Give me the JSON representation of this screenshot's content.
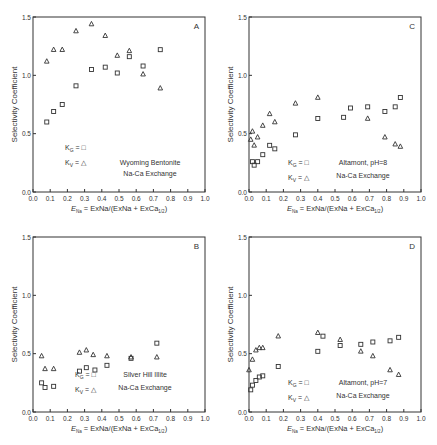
{
  "chart_data": [
    {
      "type": "scatter",
      "panel": "A",
      "title": "",
      "xlabel": "E_Na = ExNa/(ExNa + ExCa1/2)",
      "ylabel": "Selectivity Coefficient",
      "xlim": [
        0.0,
        1.0
      ],
      "ylim": [
        0.0,
        1.5
      ],
      "xticks": [
        "0.0",
        "0.1",
        "0.2",
        "0.3",
        "0.4",
        "0.5",
        "0.6",
        "0.7",
        "0.8",
        "0.9",
        "1.0"
      ],
      "yticks": [
        "0.0",
        "0.5",
        "1.0",
        "1.5"
      ],
      "grid": false,
      "legend": [
        "K_G = □",
        "K_V = △"
      ],
      "annotation": [
        "Wyoming Bentonite",
        "Na-Ca Exchange"
      ],
      "series": [
        {
          "name": "K_G",
          "marker": "square",
          "x": [
            0.08,
            0.12,
            0.17,
            0.25,
            0.34,
            0.42,
            0.49,
            0.56,
            0.64,
            0.74
          ],
          "y": [
            0.6,
            0.69,
            0.75,
            0.91,
            1.05,
            1.07,
            1.02,
            1.16,
            1.08,
            1.22
          ]
        },
        {
          "name": "K_V",
          "marker": "triangle",
          "x": [
            0.08,
            0.12,
            0.17,
            0.25,
            0.34,
            0.42,
            0.49,
            0.56,
            0.64,
            0.74
          ],
          "y": [
            1.12,
            1.22,
            1.22,
            1.38,
            1.44,
            1.34,
            1.17,
            1.21,
            1.01,
            0.89
          ]
        }
      ]
    },
    {
      "type": "scatter",
      "panel": "C",
      "title": "",
      "xlabel": "E_Na = ExNa/(ExNa + ExCa1/2)",
      "ylabel": "Selectivity Coefficient",
      "xlim": [
        0.0,
        1.0
      ],
      "ylim": [
        0.0,
        1.5
      ],
      "xticks": [
        "0.0",
        "0.1",
        "0.2",
        "0.3",
        "0.4",
        "0.5",
        "0.6",
        "0.7",
        "0.8",
        "0.9",
        "1.0"
      ],
      "yticks": [
        "0.0",
        "0.5",
        "1.0",
        "1.5"
      ],
      "grid": false,
      "legend": [
        "K_G = □",
        "K_V = △"
      ],
      "annotation": [
        "Altamont, pH=8",
        "Na-Ca Exchange"
      ],
      "series": [
        {
          "name": "K_G",
          "marker": "square",
          "x": [
            0.02,
            0.03,
            0.05,
            0.08,
            0.12,
            0.15,
            0.27,
            0.4,
            0.55,
            0.59,
            0.69,
            0.79,
            0.85,
            0.88
          ],
          "y": [
            0.26,
            0.23,
            0.26,
            0.32,
            0.4,
            0.37,
            0.49,
            0.63,
            0.64,
            0.72,
            0.73,
            0.69,
            0.73,
            0.81
          ]
        },
        {
          "name": "K_V",
          "marker": "triangle",
          "x": [
            0.01,
            0.02,
            0.03,
            0.05,
            0.08,
            0.12,
            0.15,
            0.27,
            0.4,
            0.69,
            0.79,
            0.85,
            0.88
          ],
          "y": [
            0.45,
            0.52,
            0.4,
            0.47,
            0.57,
            0.67,
            0.6,
            0.76,
            0.81,
            0.63,
            0.47,
            0.41,
            0.39
          ]
        }
      ]
    },
    {
      "type": "scatter",
      "panel": "B",
      "title": "",
      "xlabel": "E_Na = ExNa/(ExNa + ExCa1/2)",
      "ylabel": "Selectivity Coefficient",
      "xlim": [
        0.0,
        1.0
      ],
      "ylim": [
        0.0,
        1.5
      ],
      "xticks": [
        "0.0",
        "0.1",
        "0.2",
        "0.3",
        "0.4",
        "0.5",
        "0.6",
        "0.7",
        "0.8",
        "0.9",
        "1.0"
      ],
      "yticks": [
        "0.0",
        "0.5",
        "1.0",
        "1.5"
      ],
      "grid": false,
      "legend": [
        "K_G = □",
        "K_V = △"
      ],
      "annotation": [
        "Silver Hill Illite",
        "Na-Ca Exchange"
      ],
      "series": [
        {
          "name": "K_G",
          "marker": "square",
          "x": [
            0.05,
            0.07,
            0.12,
            0.27,
            0.31,
            0.36,
            0.43,
            0.57,
            0.72
          ],
          "y": [
            0.25,
            0.21,
            0.22,
            0.35,
            0.38,
            0.36,
            0.4,
            0.46,
            0.59
          ]
        },
        {
          "name": "K_V",
          "marker": "triangle",
          "x": [
            0.05,
            0.07,
            0.12,
            0.27,
            0.31,
            0.35,
            0.43,
            0.57,
            0.72
          ],
          "y": [
            0.48,
            0.37,
            0.37,
            0.51,
            0.53,
            0.49,
            0.48,
            0.47,
            0.47
          ]
        }
      ]
    },
    {
      "type": "scatter",
      "panel": "D",
      "title": "",
      "xlabel": "E_Na = ExNa/(ExNa + ExCa1/2)",
      "ylabel": "Selectivity Coefficient",
      "xlim": [
        0.0,
        1.0
      ],
      "ylim": [
        0.0,
        1.5
      ],
      "xticks": [
        "0.0",
        "0.1",
        "0.2",
        "0.3",
        "0.4",
        "0.5",
        "0.6",
        "0.7",
        "0.8",
        "0.9",
        "1.0"
      ],
      "yticks": [
        "0.0",
        "0.5",
        "1.0",
        "1.5"
      ],
      "grid": false,
      "legend": [
        "K_G = □",
        "K_V = △"
      ],
      "annotation": [
        "Altamont, pH=7",
        "Na-Ca Exchange"
      ],
      "series": [
        {
          "name": "K_G",
          "marker": "square",
          "x": [
            0.01,
            0.02,
            0.04,
            0.06,
            0.08,
            0.17,
            0.4,
            0.43,
            0.53,
            0.65,
            0.72,
            0.82,
            0.87
          ],
          "y": [
            0.19,
            0.23,
            0.27,
            0.3,
            0.31,
            0.39,
            0.52,
            0.65,
            0.57,
            0.58,
            0.6,
            0.61,
            0.64
          ]
        },
        {
          "name": "K_V",
          "marker": "triangle",
          "x": [
            0.0,
            0.02,
            0.04,
            0.06,
            0.08,
            0.17,
            0.4,
            0.53,
            0.65,
            0.72,
            0.82,
            0.87
          ],
          "y": [
            0.36,
            0.45,
            0.53,
            0.55,
            0.55,
            0.65,
            0.68,
            0.62,
            0.52,
            0.48,
            0.36,
            0.32
          ]
        }
      ]
    }
  ],
  "panels": {
    "A": {
      "letter": "A",
      "ylabel": "Selectivity Coefficient",
      "xlabel_main": "E",
      "xlabel_sub": "Na",
      "xlabel_rest": " = ExNa/(ExNa + ExCa",
      "xlabel_sub2": "1/2",
      "xlabel_end": ")",
      "legend_kg": "K",
      "legend_kg_sub": "G",
      "legend_kg_eq": " = □",
      "legend_kv": "K",
      "legend_kv_sub": "V",
      "legend_kv_eq": " = △",
      "note1": "Wyoming Bentonite",
      "note2": "Na-Ca Exchange"
    },
    "C": {
      "letter": "C",
      "ylabel": "Selectivity Coefficient",
      "xlabel_main": "E",
      "xlabel_sub": "Na",
      "xlabel_rest": " = ExNa/(ExNa + ExCa",
      "xlabel_sub2": "1/2",
      "xlabel_end": ")",
      "legend_kg": "K",
      "legend_kg_sub": "G",
      "legend_kg_eq": " = □",
      "legend_kv": "K",
      "legend_kv_sub": "V",
      "legend_kv_eq": " = △",
      "note1": "Altamont, pH=8",
      "note2": "Na-Ca Exchange"
    },
    "B": {
      "letter": "B",
      "ylabel": "Selectivity Coefficient",
      "xlabel_main": "E",
      "xlabel_sub": "Na",
      "xlabel_rest": " = ExNa/(ExNa + ExCa",
      "xlabel_sub2": "1/2",
      "xlabel_end": ")",
      "legend_kg": "K",
      "legend_kg_sub": "G",
      "legend_kg_eq": " = □",
      "legend_kv": "K",
      "legend_kv_sub": "V",
      "legend_kv_eq": " = △",
      "note1": "Silver Hill Illite",
      "note2": "Na-Ca Exchange"
    },
    "D": {
      "letter": "D",
      "ylabel": "Selectivity Coefficient",
      "xlabel_main": "E",
      "xlabel_sub": "Na",
      "xlabel_rest": " = ExNa/(ExNa + ExCa",
      "xlabel_sub2": "1/2",
      "xlabel_end": ")",
      "legend_kg": "K",
      "legend_kg_sub": "G",
      "legend_kg_eq": " = □",
      "legend_kv": "K",
      "legend_kv_sub": "V",
      "legend_kv_eq": " = △",
      "note1": "Altamont, pH=7",
      "note2": "Na-Ca Exchange"
    }
  },
  "colors": {
    "ink": "#333333",
    "background": "#ffffff"
  }
}
